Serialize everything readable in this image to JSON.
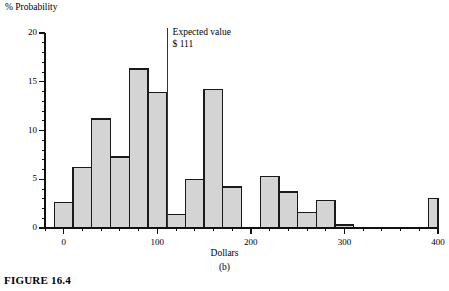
{
  "figure": {
    "caption": "FIGURE 16.4",
    "panel_label": "(b)"
  },
  "annotation": {
    "line1": "Expected value",
    "line2": "$ 111"
  },
  "chart_data": {
    "type": "bar",
    "title": "",
    "xlabel": "Dollars",
    "ylabel": "% Probability",
    "xlim": [
      -20,
      400
    ],
    "ylim": [
      0,
      20
    ],
    "grid": false,
    "legend": null,
    "bin_width": 20,
    "x_ticks": [
      0,
      100,
      200,
      300,
      400
    ],
    "x_tick_labels": [
      "0",
      "100",
      "200",
      "300",
      "400"
    ],
    "x_minor_tick_step": 20,
    "y_ticks": [
      0,
      5,
      10,
      15,
      20
    ],
    "y_tick_labels": [
      "0",
      "5",
      "10",
      "15",
      "20"
    ],
    "y_minor_tick_step": 1,
    "bar_fill_color": "#d4d4d4",
    "bar_edge_color": "#1a1a1a",
    "categories": [
      "-10 to 10",
      "10 to 30",
      "30 to 50",
      "50 to 70",
      "70 to 90",
      "90 to 110",
      "110 to 130",
      "130 to 150",
      "150 to 170",
      "170 to 190",
      "190 to 210",
      "210 to 230",
      "230 to 250",
      "250 to 270",
      "270 to 290",
      "290 to 310",
      "310 to 330",
      "330 to 350",
      "350 to 370",
      "370 to 390",
      "390 to 400"
    ],
    "bin_edges": [
      -10,
      10,
      30,
      50,
      70,
      90,
      110,
      130,
      150,
      170,
      190,
      210,
      230,
      250,
      270,
      290,
      310,
      330,
      350,
      370,
      390,
      400
    ],
    "values": [
      2.6,
      6.2,
      11.2,
      7.3,
      16.3,
      13.9,
      1.4,
      5.0,
      14.2,
      4.2,
      0.0,
      5.3,
      3.7,
      1.6,
      2.8,
      0.3,
      0.0,
      0.0,
      0.0,
      0.0,
      3.0
    ],
    "annotations": [
      {
        "type": "vline",
        "x": 111,
        "label": "Expected value $ 111"
      }
    ]
  }
}
